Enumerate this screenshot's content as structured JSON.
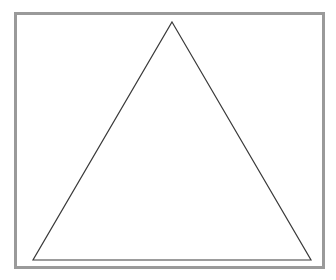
{
  "figure": {
    "type": "geometric-line-drawing",
    "background_color": "#ffffff",
    "canvas": {
      "width": 336,
      "height": 280
    },
    "frame": {
      "name": "border-frame",
      "shape": "rectangle",
      "stroke_color": "#9a9a9a",
      "stroke_width": 3,
      "fill": "none",
      "x": 15.5,
      "y": 13.5,
      "width": 308,
      "height": 254
    },
    "shape": {
      "name": "triangle",
      "kind": "isosceles-triangle",
      "stroke_color": "#3a3a3a",
      "stroke_width": 1.2,
      "fill": "none",
      "vertices": [
        {
          "label": "apex",
          "x": 172,
          "y": 22
        },
        {
          "label": "bottom-right",
          "x": 311,
          "y": 260
        },
        {
          "label": "bottom-left",
          "x": 33,
          "y": 260
        }
      ],
      "points": "172,22 311,260 33,260",
      "base_width": 278,
      "height": 238
    }
  }
}
